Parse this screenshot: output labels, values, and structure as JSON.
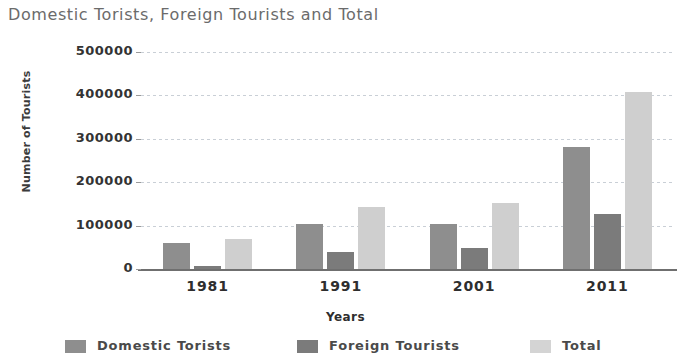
{
  "chart_data": {
    "type": "bar",
    "title": "Domestic Torists, Foreign Tourists and Total",
    "xlabel": "Years",
    "ylabel": "Number of Tourists",
    "categories": [
      "1981",
      "1991",
      "2001",
      "2011"
    ],
    "series": [
      {
        "name": "Domestic Torists",
        "color": "#8e8e8e",
        "values": [
          60000,
          103000,
          104000,
          282000
        ]
      },
      {
        "name": "Foreign Tourists",
        "color": "#7b7b7b",
        "values": [
          8000,
          40000,
          48000,
          126000
        ]
      },
      {
        "name": "Total",
        "color": "#cfcfcf",
        "values": [
          70000,
          142000,
          152000,
          408000
        ]
      }
    ],
    "ylim": [
      0,
      500000
    ],
    "yticks": [
      0,
      100000,
      200000,
      300000,
      400000,
      500000
    ],
    "ytick_labels": [
      "0",
      "100000",
      "200000",
      "300000",
      "400000",
      "500000"
    ],
    "grid": true,
    "grid_axis": "y",
    "legend_position": "bottom"
  }
}
